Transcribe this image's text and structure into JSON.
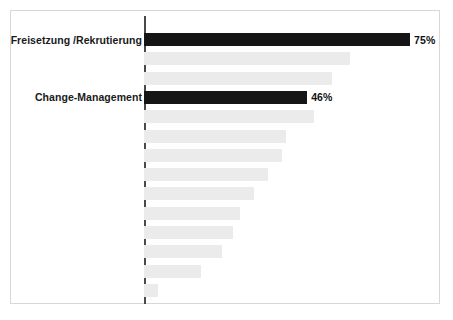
{
  "chart_data": {
    "type": "bar",
    "orientation": "horizontal",
    "title": "",
    "subtitle": "",
    "xlabel": "",
    "ylabel": "",
    "xlim": [
      0,
      80
    ],
    "grid": false,
    "legend": null,
    "axis_color": "#4a4a4a",
    "bar_color_normal": "#ebebeb",
    "bar_color_highlight": "#151515",
    "frame_color": "#d8d8d8",
    "background": "#ffffff",
    "categories": [
      "Freisetzung /Rekrutierung",
      "",
      "",
      "Change-Management",
      "",
      "",
      "",
      "",
      "",
      "",
      "",
      "",
      "",
      ""
    ],
    "values": [
      75,
      58,
      53,
      46,
      48,
      40,
      39,
      35,
      31,
      27,
      25,
      22,
      16,
      4
    ],
    "labels_shown": [
      "75%",
      "",
      "",
      "46%",
      "",
      "",
      "",
      "",
      "",
      "",
      "",
      "",
      "",
      ""
    ],
    "highlighted_indices": [
      0,
      3
    ],
    "bars": [
      {
        "label": "Freisetzung /Rekrutierung",
        "value": 75,
        "value_label": "75%",
        "highlight": true
      },
      {
        "label": "",
        "value": 58,
        "value_label": "",
        "highlight": false
      },
      {
        "label": "",
        "value": 53,
        "value_label": "",
        "highlight": false
      },
      {
        "label": "Change-Management",
        "value": 46,
        "value_label": "46%",
        "highlight": true
      },
      {
        "label": "",
        "value": 48,
        "value_label": "",
        "highlight": false
      },
      {
        "label": "",
        "value": 40,
        "value_label": "",
        "highlight": false
      },
      {
        "label": "",
        "value": 39,
        "value_label": "",
        "highlight": false
      },
      {
        "label": "",
        "value": 35,
        "value_label": "",
        "highlight": false
      },
      {
        "label": "",
        "value": 31,
        "value_label": "",
        "highlight": false
      },
      {
        "label": "",
        "value": 27,
        "value_label": "",
        "highlight": false
      },
      {
        "label": "",
        "value": 25,
        "value_label": "",
        "highlight": false
      },
      {
        "label": "",
        "value": 22,
        "value_label": "",
        "highlight": false
      },
      {
        "label": "",
        "value": 16,
        "value_label": "",
        "highlight": false
      },
      {
        "label": "",
        "value": 4,
        "value_label": "",
        "highlight": false
      }
    ]
  },
  "layout": {
    "axis_x_px": 144,
    "px_per_unit": 3.547,
    "first_bar_top_px": 33,
    "row_pitch_px": 19.3,
    "bar_height_px": 13
  }
}
